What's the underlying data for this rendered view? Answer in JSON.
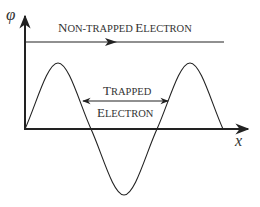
{
  "diagram": {
    "y_axis_label": "φ",
    "x_axis_label": "x",
    "non_trapped_label_big1": "N",
    "non_trapped_label_small1": "ON-TRAPPED ",
    "non_trapped_label_big2": "E",
    "non_trapped_label_small2": "LECTRON",
    "trapped_big1": "T",
    "trapped_small1": "RAPPED",
    "trapped_big2": "E",
    "trapped_small2": "LECTRON",
    "full_labels": [
      "Non-trapped Electron",
      "Trapped Electron"
    ],
    "colors": {
      "line": "#222222",
      "text": "#333333"
    }
  }
}
